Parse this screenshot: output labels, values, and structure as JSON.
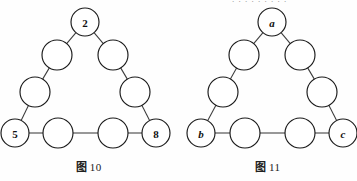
{
  "page": {
    "background_color": "#fefefe",
    "ink_color": "#1a1a1a",
    "edge_color": "#3b3b3b",
    "partial_top_text": ". . . . . . . . ."
  },
  "figures": [
    {
      "id": "figure-left",
      "caption_prefix": "图",
      "caption_number": "10",
      "caption_full": "图 10",
      "shape": "triangle-of-circles",
      "node_count": 9,
      "nodes": [
        {
          "name": "apex",
          "label": "2",
          "style": "bold",
          "cx": 85,
          "cy": 22,
          "r": 14
        },
        {
          "name": "upper-left",
          "label": "",
          "style": "plain",
          "cx": 57,
          "cy": 55,
          "r": 15
        },
        {
          "name": "upper-right",
          "label": "",
          "style": "plain",
          "cx": 113,
          "cy": 55,
          "r": 15
        },
        {
          "name": "mid-left",
          "label": "",
          "style": "plain",
          "cx": 35,
          "cy": 92,
          "r": 15
        },
        {
          "name": "mid-right",
          "label": "",
          "style": "plain",
          "cx": 135,
          "cy": 92,
          "r": 15
        },
        {
          "name": "bottom-left",
          "label": "5",
          "style": "bold",
          "cx": 15,
          "cy": 133,
          "r": 14
        },
        {
          "name": "bottom-mid-1",
          "label": "",
          "style": "plain",
          "cx": 58,
          "cy": 133,
          "r": 15
        },
        {
          "name": "bottom-mid-2",
          "label": "",
          "style": "plain",
          "cx": 113,
          "cy": 133,
          "r": 15
        },
        {
          "name": "bottom-right",
          "label": "8",
          "style": "bold",
          "cx": 156,
          "cy": 133,
          "r": 14
        }
      ],
      "edges": [
        [
          "apex",
          "upper-left"
        ],
        [
          "apex",
          "upper-right"
        ],
        [
          "upper-left",
          "mid-left"
        ],
        [
          "upper-right",
          "mid-right"
        ],
        [
          "mid-left",
          "bottom-left"
        ],
        [
          "mid-right",
          "bottom-right"
        ],
        [
          "bottom-left",
          "bottom-mid-1"
        ],
        [
          "bottom-mid-1",
          "bottom-mid-2"
        ],
        [
          "bottom-mid-2",
          "bottom-right"
        ]
      ]
    },
    {
      "id": "figure-right",
      "caption_prefix": "图",
      "caption_number": "11",
      "caption_full": "图 11",
      "shape": "triangle-of-circles",
      "node_count": 9,
      "nodes": [
        {
          "name": "apex",
          "label": "a",
          "style": "italic",
          "cx": 93,
          "cy": 22,
          "r": 14
        },
        {
          "name": "upper-left",
          "label": "",
          "style": "plain",
          "cx": 65,
          "cy": 55,
          "r": 15
        },
        {
          "name": "upper-right",
          "label": "",
          "style": "plain",
          "cx": 121,
          "cy": 55,
          "r": 15
        },
        {
          "name": "mid-left",
          "label": "",
          "style": "plain",
          "cx": 44,
          "cy": 92,
          "r": 15
        },
        {
          "name": "mid-right",
          "label": "",
          "style": "plain",
          "cx": 143,
          "cy": 92,
          "r": 15
        },
        {
          "name": "bottom-left",
          "label": "b",
          "style": "italic",
          "cx": 22,
          "cy": 133,
          "r": 14
        },
        {
          "name": "bottom-mid-1",
          "label": "",
          "style": "plain",
          "cx": 66,
          "cy": 133,
          "r": 15
        },
        {
          "name": "bottom-mid-2",
          "label": "",
          "style": "plain",
          "cx": 121,
          "cy": 133,
          "r": 15
        },
        {
          "name": "bottom-right",
          "label": "c",
          "style": "italic",
          "cx": 164,
          "cy": 133,
          "r": 14
        }
      ],
      "edges": [
        [
          "apex",
          "upper-left"
        ],
        [
          "apex",
          "upper-right"
        ],
        [
          "upper-left",
          "mid-left"
        ],
        [
          "upper-right",
          "mid-right"
        ],
        [
          "mid-left",
          "bottom-left"
        ],
        [
          "mid-right",
          "bottom-right"
        ],
        [
          "bottom-left",
          "bottom-mid-1"
        ],
        [
          "bottom-mid-1",
          "bottom-mid-2"
        ],
        [
          "bottom-mid-2",
          "bottom-right"
        ]
      ]
    }
  ]
}
